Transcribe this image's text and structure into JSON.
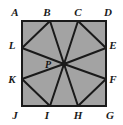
{
  "figure": {
    "type": "geometry-diagram",
    "canvas": {
      "width": 123,
      "height": 125
    },
    "colors": {
      "background": "#ffffff",
      "fill": "#a3a3a3",
      "stroke": "#1a1a1a",
      "label": "#1a1a1a"
    },
    "square": {
      "name": "ADGJ",
      "left": 22,
      "top": 21,
      "right": 106,
      "bottom": 106,
      "stroke_width": 2
    },
    "center_point": {
      "label": "P",
      "x": 64,
      "y": 64
    },
    "points": [
      {
        "label": "A",
        "x": 22,
        "y": 21,
        "on": "corner-top-left",
        "label_x": 15,
        "label_y": 12
      },
      {
        "label": "B",
        "x": 50,
        "y": 21,
        "on": "top-edge",
        "label_x": 47,
        "label_y": 12
      },
      {
        "label": "C",
        "x": 78,
        "y": 21,
        "on": "top-edge",
        "label_x": 78,
        "label_y": 12
      },
      {
        "label": "D",
        "x": 106,
        "y": 21,
        "on": "corner-top-right",
        "label_x": 108,
        "label_y": 12
      },
      {
        "label": "E",
        "x": 106,
        "y": 48,
        "on": "right-edge",
        "label_x": 113,
        "label_y": 45
      },
      {
        "label": "F",
        "x": 106,
        "y": 79,
        "on": "right-edge",
        "label_x": 113,
        "label_y": 79
      },
      {
        "label": "G",
        "x": 106,
        "y": 106,
        "on": "corner-bottom-right",
        "label_x": 110,
        "label_y": 115
      },
      {
        "label": "H",
        "x": 78,
        "y": 106,
        "on": "bottom-edge",
        "label_x": 78,
        "label_y": 115
      },
      {
        "label": "I",
        "x": 50,
        "y": 106,
        "on": "bottom-edge",
        "label_x": 47,
        "label_y": 115
      },
      {
        "label": "J",
        "x": 22,
        "y": 106,
        "on": "corner-bottom-left",
        "label_x": 15,
        "label_y": 115
      },
      {
        "label": "K",
        "x": 22,
        "y": 79,
        "on": "left-edge",
        "label_x": 12,
        "label_y": 79
      },
      {
        "label": "L",
        "x": 22,
        "y": 48,
        "on": "left-edge",
        "label_x": 12,
        "label_y": 45
      }
    ],
    "spokes": [
      {
        "from": "P",
        "to": "B"
      },
      {
        "from": "P",
        "to": "C"
      },
      {
        "from": "P",
        "to": "E"
      },
      {
        "from": "P",
        "to": "F"
      },
      {
        "from": "P",
        "to": "H"
      },
      {
        "from": "P",
        "to": "I"
      },
      {
        "from": "P",
        "to": "K"
      },
      {
        "from": "P",
        "to": "L"
      }
    ],
    "chords": [
      {
        "from": "L",
        "to": "B"
      },
      {
        "from": "C",
        "to": "E"
      },
      {
        "from": "F",
        "to": "H"
      },
      {
        "from": "I",
        "to": "K"
      }
    ],
    "inner_label": {
      "text": "P",
      "x": 48,
      "y": 64
    }
  }
}
